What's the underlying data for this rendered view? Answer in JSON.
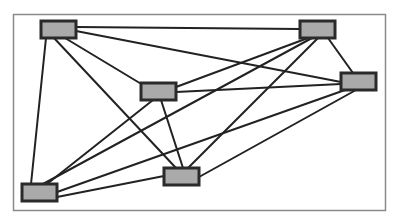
{
  "diagram": {
    "type": "network-graph",
    "frame": {
      "x": 13,
      "y": 14,
      "width": 372,
      "height": 196,
      "stroke": "#8a8a8a"
    },
    "node_style": {
      "fill": "#aaaaaa",
      "stroke": "#2a2a2a",
      "stroke_width": 3
    },
    "edge_style": {
      "stroke": "#222222",
      "stroke_width": 2
    },
    "nodes": [
      {
        "id": "A",
        "x": 41,
        "y": 21,
        "width": 35,
        "height": 17
      },
      {
        "id": "B",
        "x": 300,
        "y": 21,
        "width": 35,
        "height": 17
      },
      {
        "id": "C",
        "x": 341,
        "y": 73,
        "width": 35,
        "height": 17
      },
      {
        "id": "D",
        "x": 141,
        "y": 83,
        "width": 35,
        "height": 17
      },
      {
        "id": "E",
        "x": 164,
        "y": 168,
        "width": 35,
        "height": 17
      },
      {
        "id": "F",
        "x": 22,
        "y": 184,
        "width": 35,
        "height": 17
      }
    ],
    "edges": [
      {
        "from": "A",
        "to": "B",
        "x1": 76,
        "y1": 27,
        "x2": 300,
        "y2": 29
      },
      {
        "from": "A",
        "to": "C",
        "x1": 76,
        "y1": 31,
        "x2": 341,
        "y2": 82
      },
      {
        "from": "A",
        "to": "D",
        "x1": 65,
        "y1": 38,
        "x2": 143,
        "y2": 85
      },
      {
        "from": "A",
        "to": "E",
        "x1": 54,
        "y1": 38,
        "x2": 176,
        "y2": 168
      },
      {
        "from": "A",
        "to": "F",
        "x1": 46,
        "y1": 38,
        "x2": 31,
        "y2": 184
      },
      {
        "from": "B",
        "to": "D",
        "x1": 308,
        "y1": 38,
        "x2": 176,
        "y2": 87
      },
      {
        "from": "B",
        "to": "F",
        "x1": 312,
        "y1": 38,
        "x2": 43,
        "y2": 184
      },
      {
        "from": "B",
        "to": "E",
        "x1": 318,
        "y1": 38,
        "x2": 188,
        "y2": 168
      },
      {
        "from": "B",
        "to": "C",
        "x1": 328,
        "y1": 38,
        "x2": 353,
        "y2": 73
      },
      {
        "from": "C",
        "to": "D",
        "x1": 341,
        "y1": 84,
        "x2": 176,
        "y2": 92
      },
      {
        "from": "C",
        "to": "F",
        "x1": 345,
        "y1": 90,
        "x2": 57,
        "y2": 192
      },
      {
        "from": "C",
        "to": "E",
        "x1": 356,
        "y1": 90,
        "x2": 199,
        "y2": 177
      },
      {
        "from": "D",
        "to": "F",
        "x1": 153,
        "y1": 100,
        "x2": 47,
        "y2": 184
      },
      {
        "from": "D",
        "to": "E",
        "x1": 161,
        "y1": 100,
        "x2": 183,
        "y2": 168
      },
      {
        "from": "E",
        "to": "F",
        "x1": 164,
        "y1": 176,
        "x2": 57,
        "y2": 197
      }
    ]
  }
}
